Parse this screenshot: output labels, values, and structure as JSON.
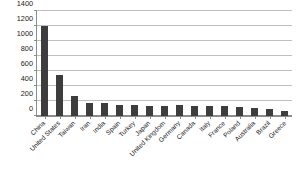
{
  "chart_data": {
    "type": "bar",
    "title": "",
    "subtitle": "",
    "xlabel": "",
    "ylabel": "",
    "ylim": [
      0,
      1400
    ],
    "yticks": [
      0,
      200,
      400,
      600,
      800,
      1000,
      1200,
      1400
    ],
    "grid": true,
    "legend": false,
    "legend_position": "none",
    "bar_color": "#3d3d3d",
    "gridline_color": "#bfbfbf",
    "axis_color": "#8c8c8c",
    "categories": [
      "China",
      "United States",
      "Taiwan",
      "Iran",
      "India",
      "Spain",
      "Turkey",
      "Japan",
      "United Kingdom",
      "Germany",
      "Canada",
      "Italy",
      "France",
      "Poland",
      "Australia",
      "Brazil",
      "Greece"
    ],
    "values": [
      1205,
      550,
      265,
      175,
      175,
      152,
      148,
      140,
      140,
      145,
      135,
      130,
      135,
      120,
      110,
      90,
      70
    ]
  }
}
